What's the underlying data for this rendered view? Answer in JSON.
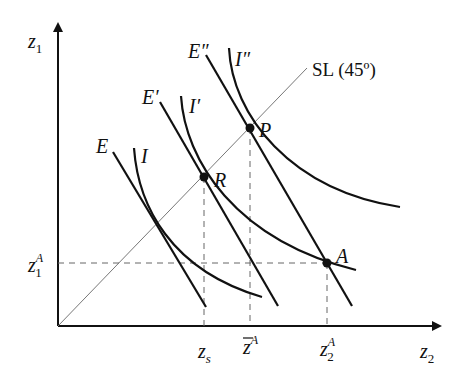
{
  "diagram": {
    "type": "indifference-curve-diagram",
    "axes": {
      "y_label": "z",
      "y_sub": "1",
      "x_label": "z",
      "x_sub": "2"
    },
    "ray": {
      "label": "SL (45º)"
    },
    "budget_lines": [
      {
        "label": "E"
      },
      {
        "label": "E′"
      },
      {
        "label": "E″"
      }
    ],
    "indifference_curves": [
      {
        "label": "I"
      },
      {
        "label": "I′"
      },
      {
        "label": "I″"
      }
    ],
    "points": [
      {
        "label": "P"
      },
      {
        "label": "R"
      },
      {
        "label": "A"
      }
    ],
    "x_ticks": [
      {
        "base": "z",
        "sub": "s",
        "sup": ""
      },
      {
        "base": "z",
        "sub": "",
        "sup": "A",
        "overline": true
      },
      {
        "base": "z",
        "sub": "2",
        "sup": "A"
      }
    ],
    "y_ticks": [
      {
        "base": "z",
        "sub": "1",
        "sup": "A"
      }
    ]
  }
}
